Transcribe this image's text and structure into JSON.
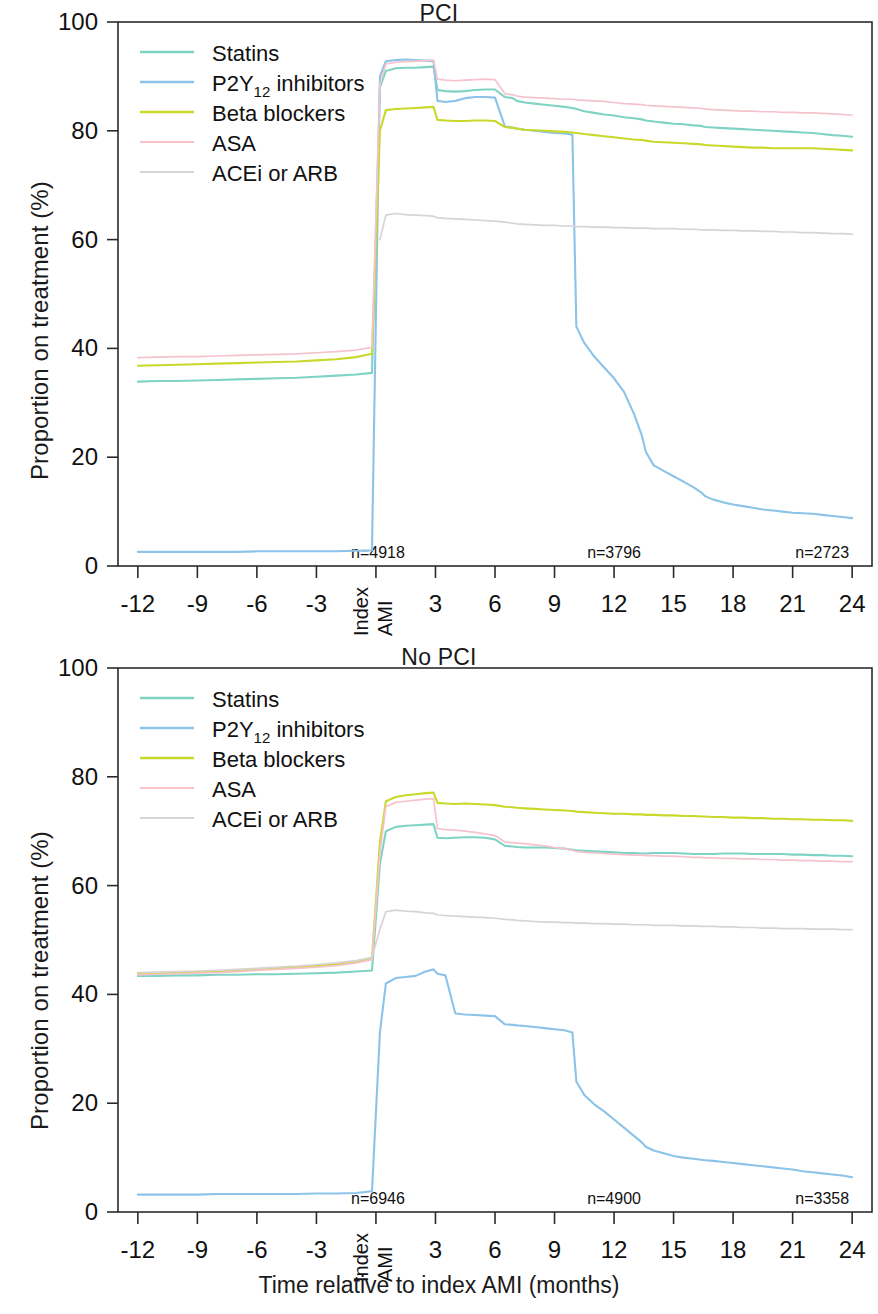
{
  "figure": {
    "xlabel": "Time relative to index AMI (months)",
    "ylabel": "Proportion on treatment (%)"
  },
  "legend": {
    "items": [
      {
        "label": "Statins",
        "sub": "",
        "tail": "",
        "color": "#7fd3c4",
        "key": "statins"
      },
      {
        "label": "P2Y",
        "sub": "12",
        "tail": " inhibitors",
        "color": "#8cc3e8",
        "key": "p2y12"
      },
      {
        "label": "Beta blockers",
        "sub": "",
        "tail": "",
        "color": "#c8d92c",
        "key": "beta"
      },
      {
        "label": "ASA",
        "sub": "",
        "tail": "",
        "color": "#f6c3cd",
        "key": "asa"
      },
      {
        "label": "ACEi or ARB",
        "sub": "",
        "tail": "",
        "color": "#d9d3d6",
        "key": "acei"
      }
    ]
  },
  "axis": {
    "y_ticks": [
      "0",
      "20",
      "40",
      "60",
      "80",
      "100"
    ],
    "y_values": [
      0,
      20,
      40,
      60,
      80,
      100
    ],
    "ylim": [
      0,
      100
    ],
    "x_ticks": [
      "-12",
      "-9",
      "-6",
      "-3",
      "",
      "3",
      "6",
      "9",
      "12",
      "15",
      "18",
      "21",
      "24"
    ],
    "x_values": [
      -12,
      -9,
      -6,
      -3,
      0,
      3,
      6,
      9,
      12,
      15,
      18,
      21,
      24
    ],
    "xlim": [
      -13,
      25
    ],
    "index_label_left": "Index",
    "index_label_right": "AMI"
  },
  "chart_data": [
    {
      "type": "line",
      "title": "PCI",
      "xlabel": "Time relative to index AMI (months)",
      "ylabel": "Proportion on treatment (%)",
      "xlim": [
        -13,
        25
      ],
      "ylim": [
        0,
        100
      ],
      "grid": false,
      "legend_position": "top-left",
      "annotations": [
        {
          "text": "n=4918",
          "x": 0
        },
        {
          "text": "n=3796",
          "x": 12
        },
        {
          "text": "n=2723",
          "x": 24
        }
      ],
      "x": [
        -12,
        -11,
        -10,
        -9,
        -8,
        -7,
        -6,
        -5,
        -4,
        -3,
        -2,
        -1,
        -0.2,
        0.2,
        0.5,
        1,
        1.5,
        2,
        2.5,
        2.9,
        3.1,
        3.5,
        4,
        4.5,
        5,
        5.5,
        6,
        6.5,
        6.9,
        7.1,
        7.5,
        8,
        8.5,
        9,
        9.5,
        9.9,
        10.1,
        10.5,
        11,
        11.5,
        12,
        12.5,
        13,
        13.4,
        13.6,
        14,
        14.5,
        15,
        15.5,
        16,
        16.4,
        16.6,
        17,
        17.5,
        18,
        18.5,
        19,
        19.5,
        20,
        20.5,
        21,
        21.5,
        22,
        22.5,
        23,
        23.5,
        24
      ],
      "series": [
        {
          "name": "Statins",
          "color": "#7fd3c4",
          "values": [
            33.9,
            34.0,
            34.0,
            34.1,
            34.2,
            34.3,
            34.4,
            34.5,
            34.6,
            34.8,
            35.0,
            35.2,
            35.5,
            88.0,
            91.0,
            91.5,
            91.6,
            91.6,
            91.7,
            91.8,
            87.5,
            87.3,
            87.2,
            87.3,
            87.5,
            87.6,
            87.6,
            86.2,
            86.0,
            85.5,
            85.2,
            85.0,
            84.8,
            84.6,
            84.4,
            84.2,
            84.0,
            83.6,
            83.3,
            83.0,
            82.8,
            82.5,
            82.3,
            82.1,
            81.9,
            81.7,
            81.5,
            81.3,
            81.2,
            81.0,
            80.9,
            80.7,
            80.6,
            80.5,
            80.4,
            80.3,
            80.2,
            80.1,
            80.0,
            79.9,
            79.8,
            79.7,
            79.6,
            79.4,
            79.2,
            79.1,
            78.9
          ]
        },
        {
          "name": "P2Y12 inhibitors",
          "color": "#8cc3e8",
          "values": [
            2.6,
            2.6,
            2.6,
            2.6,
            2.6,
            2.6,
            2.7,
            2.7,
            2.7,
            2.7,
            2.7,
            2.8,
            2.9,
            90.0,
            92.8,
            93.0,
            93.1,
            93.0,
            92.9,
            92.8,
            85.5,
            85.3,
            85.5,
            86.0,
            86.2,
            86.2,
            86.1,
            80.8,
            80.6,
            80.4,
            80.2,
            80.0,
            79.8,
            79.6,
            79.5,
            79.3,
            44.0,
            41.0,
            38.5,
            36.5,
            34.5,
            32.0,
            28.0,
            24.0,
            21.0,
            18.5,
            17.5,
            16.5,
            15.5,
            14.5,
            13.5,
            12.8,
            12.2,
            11.7,
            11.3,
            11.0,
            10.7,
            10.4,
            10.2,
            10.0,
            9.8,
            9.7,
            9.6,
            9.4,
            9.2,
            9.0,
            8.8
          ]
        },
        {
          "name": "Beta blockers",
          "color": "#c8d92c",
          "values": [
            36.8,
            36.9,
            37.0,
            37.1,
            37.2,
            37.3,
            37.4,
            37.5,
            37.6,
            37.8,
            38.0,
            38.4,
            39.0,
            80.0,
            83.8,
            84.0,
            84.1,
            84.2,
            84.3,
            84.4,
            82.0,
            81.9,
            81.8,
            81.8,
            81.9,
            81.9,
            81.8,
            80.7,
            80.5,
            80.4,
            80.2,
            80.1,
            80.0,
            79.9,
            79.8,
            79.7,
            79.6,
            79.4,
            79.2,
            79.0,
            78.8,
            78.6,
            78.4,
            78.3,
            78.2,
            78.0,
            77.9,
            77.8,
            77.7,
            77.6,
            77.5,
            77.4,
            77.3,
            77.2,
            77.1,
            77.0,
            76.9,
            76.9,
            76.8,
            76.8,
            76.8,
            76.8,
            76.8,
            76.7,
            76.6,
            76.5,
            76.4
          ]
        },
        {
          "name": "ASA",
          "color": "#f6c3cd",
          "values": [
            38.3,
            38.4,
            38.5,
            38.5,
            38.6,
            38.7,
            38.8,
            38.9,
            39.0,
            39.2,
            39.4,
            39.7,
            40.2,
            88.5,
            92.3,
            92.6,
            92.7,
            92.8,
            92.9,
            93.0,
            89.5,
            89.3,
            89.2,
            89.3,
            89.4,
            89.5,
            89.4,
            86.8,
            86.6,
            86.4,
            86.2,
            86.1,
            86.0,
            85.9,
            85.8,
            85.8,
            85.7,
            85.6,
            85.5,
            85.4,
            85.2,
            85.0,
            84.9,
            84.8,
            84.7,
            84.6,
            84.5,
            84.4,
            84.3,
            84.2,
            84.1,
            84.0,
            83.9,
            83.8,
            83.7,
            83.6,
            83.6,
            83.5,
            83.5,
            83.4,
            83.4,
            83.3,
            83.3,
            83.2,
            83.1,
            83.0,
            82.9
          ]
        },
        {
          "name": "ACEi or ARB",
          "color": "#d9d3d6",
          "values": [
            0,
            0,
            0,
            0,
            0,
            0,
            0,
            0,
            0,
            0,
            0,
            0,
            0,
            60.0,
            64.5,
            64.8,
            64.6,
            64.5,
            64.4,
            64.3,
            64.0,
            63.9,
            63.8,
            63.7,
            63.6,
            63.5,
            63.4,
            63.2,
            63.0,
            62.9,
            62.8,
            62.7,
            62.6,
            62.6,
            62.5,
            62.5,
            62.4,
            62.4,
            62.3,
            62.3,
            62.2,
            62.2,
            62.1,
            62.1,
            62.1,
            62.0,
            62.0,
            62.0,
            61.9,
            61.9,
            61.8,
            61.8,
            61.8,
            61.7,
            61.7,
            61.6,
            61.6,
            61.5,
            61.5,
            61.4,
            61.4,
            61.3,
            61.3,
            61.2,
            61.1,
            61.1,
            61.0
          ],
          "start_index": 13
        }
      ]
    },
    {
      "type": "line",
      "title": "No PCI",
      "xlabel": "Time relative to index AMI (months)",
      "ylabel": "Proportion on treatment (%)",
      "xlim": [
        -13,
        25
      ],
      "ylim": [
        0,
        100
      ],
      "grid": false,
      "legend_position": "top-left",
      "annotations": [
        {
          "text": "n=6946",
          "x": 0
        },
        {
          "text": "n=4900",
          "x": 12
        },
        {
          "text": "n=3358",
          "x": 24
        }
      ],
      "x": [
        -12,
        -11,
        -10,
        -9,
        -8,
        -7,
        -6,
        -5,
        -4,
        -3,
        -2,
        -1,
        -0.2,
        0.2,
        0.5,
        1,
        1.5,
        2,
        2.5,
        2.9,
        3.1,
        3.5,
        4,
        4.5,
        5,
        5.5,
        6,
        6.5,
        6.9,
        7.1,
        7.5,
        8,
        8.5,
        9,
        9.5,
        9.9,
        10.1,
        10.5,
        11,
        11.5,
        12,
        12.5,
        13,
        13.4,
        13.6,
        14,
        14.5,
        15,
        15.5,
        16,
        16.4,
        16.6,
        17,
        17.5,
        18,
        18.5,
        19,
        19.5,
        20,
        20.5,
        21,
        21.5,
        22,
        22.5,
        23,
        23.5,
        24
      ],
      "series": [
        {
          "name": "Statins",
          "color": "#7fd3c4",
          "values": [
            43.4,
            43.4,
            43.5,
            43.5,
            43.6,
            43.6,
            43.7,
            43.7,
            43.8,
            43.9,
            44.0,
            44.2,
            44.4,
            64.0,
            70.0,
            70.8,
            71.0,
            71.1,
            71.2,
            71.3,
            68.8,
            68.7,
            68.8,
            68.9,
            68.9,
            68.8,
            68.5,
            67.3,
            67.2,
            67.1,
            67.0,
            67.0,
            67.0,
            66.9,
            66.8,
            66.6,
            66.5,
            66.4,
            66.3,
            66.2,
            66.1,
            66.0,
            66.0,
            65.9,
            65.9,
            66.0,
            66.0,
            66.0,
            65.9,
            65.8,
            65.8,
            65.8,
            65.8,
            65.9,
            65.9,
            65.9,
            65.8,
            65.8,
            65.8,
            65.8,
            65.7,
            65.7,
            65.6,
            65.6,
            65.5,
            65.5,
            65.4
          ]
        },
        {
          "name": "P2Y12 inhibitors",
          "color": "#8cc3e8",
          "values": [
            3.2,
            3.2,
            3.2,
            3.2,
            3.3,
            3.3,
            3.3,
            3.3,
            3.3,
            3.4,
            3.4,
            3.5,
            3.8,
            33.0,
            42.0,
            43.0,
            43.2,
            43.4,
            44.2,
            44.6,
            43.8,
            43.5,
            36.5,
            36.3,
            36.2,
            36.1,
            36.0,
            34.5,
            34.4,
            34.3,
            34.2,
            34.0,
            33.8,
            33.6,
            33.4,
            33.0,
            24.0,
            21.5,
            19.8,
            18.5,
            17.0,
            15.5,
            14.0,
            12.8,
            12.0,
            11.3,
            10.8,
            10.3,
            10.0,
            9.8,
            9.6,
            9.5,
            9.4,
            9.2,
            9.0,
            8.8,
            8.6,
            8.4,
            8.2,
            8.0,
            7.8,
            7.5,
            7.3,
            7.1,
            6.9,
            6.7,
            6.4
          ]
        },
        {
          "name": "Beta blockers",
          "color": "#c8d92c",
          "values": [
            43.8,
            43.9,
            44.0,
            44.1,
            44.2,
            44.4,
            44.6,
            44.8,
            45.0,
            45.2,
            45.5,
            46.0,
            46.6,
            68.0,
            75.5,
            76.3,
            76.6,
            76.8,
            77.0,
            77.1,
            75.2,
            75.1,
            75.0,
            75.1,
            75.0,
            74.9,
            74.8,
            74.5,
            74.4,
            74.3,
            74.2,
            74.1,
            74.0,
            73.9,
            73.8,
            73.7,
            73.6,
            73.5,
            73.4,
            73.3,
            73.2,
            73.2,
            73.1,
            73.1,
            73.0,
            73.0,
            72.9,
            72.9,
            72.8,
            72.8,
            72.7,
            72.7,
            72.6,
            72.6,
            72.5,
            72.5,
            72.4,
            72.4,
            72.3,
            72.3,
            72.2,
            72.2,
            72.1,
            72.1,
            72.0,
            72.0,
            71.9
          ]
        },
        {
          "name": "ASA",
          "color": "#f6c3cd",
          "values": [
            43.6,
            43.7,
            43.8,
            43.9,
            44.0,
            44.2,
            44.4,
            44.6,
            44.8,
            45.0,
            45.3,
            45.8,
            46.4,
            66.0,
            74.5,
            75.3,
            75.5,
            75.7,
            75.9,
            76.0,
            70.5,
            70.3,
            70.2,
            70.0,
            69.8,
            69.5,
            69.2,
            68.0,
            67.9,
            67.8,
            67.7,
            67.5,
            67.3,
            67.0,
            66.8,
            66.5,
            66.3,
            66.1,
            66.0,
            65.9,
            65.8,
            65.7,
            65.6,
            65.6,
            65.5,
            65.5,
            65.4,
            65.4,
            65.3,
            65.2,
            65.2,
            65.1,
            65.1,
            65.0,
            65.0,
            64.9,
            64.9,
            64.8,
            64.8,
            64.7,
            64.7,
            64.6,
            64.6,
            64.5,
            64.5,
            64.4,
            64.4
          ],
          "start_index": 0
        },
        {
          "name": "ACEi or ARB",
          "color": "#d9d3d6",
          "values": [
            44.0,
            44.1,
            44.2,
            44.3,
            44.4,
            44.6,
            44.8,
            45.0,
            45.2,
            45.5,
            45.8,
            46.2,
            46.8,
            52.0,
            55.2,
            55.5,
            55.3,
            55.2,
            55.0,
            54.9,
            54.6,
            54.5,
            54.4,
            54.3,
            54.2,
            54.1,
            54.0,
            53.8,
            53.7,
            53.6,
            53.5,
            53.4,
            53.3,
            53.3,
            53.2,
            53.2,
            53.1,
            53.1,
            53.0,
            53.0,
            52.9,
            52.9,
            52.8,
            52.8,
            52.8,
            52.7,
            52.7,
            52.7,
            52.6,
            52.6,
            52.5,
            52.5,
            52.5,
            52.4,
            52.4,
            52.3,
            52.3,
            52.2,
            52.2,
            52.1,
            52.1,
            52.1,
            52.0,
            52.0,
            52.0,
            51.9,
            51.9
          ]
        }
      ]
    }
  ]
}
